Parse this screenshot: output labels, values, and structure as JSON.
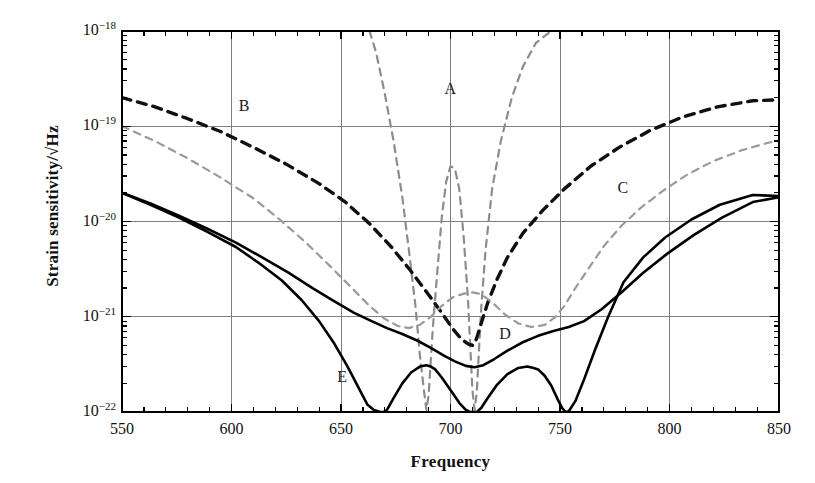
{
  "chart_data": {
    "type": "line",
    "title": "",
    "xlabel": "Frequency",
    "ylabel": "Strain sensitivity/√Hz",
    "xlim": [
      550,
      850
    ],
    "ylim": [
      1e-22,
      1e-18
    ],
    "yscale": "log",
    "xticks": [
      550,
      600,
      650,
      700,
      750,
      800,
      850
    ],
    "xtick_labels": [
      "550",
      "600",
      "650",
      "700",
      "750",
      "800",
      "850"
    ],
    "ytick_labels": [
      "10⁻¹⁸",
      "10⁻¹⁹",
      "10⁻²⁰",
      "10⁻²¹",
      "10⁻²²"
    ],
    "ytick_values": [
      1e-18,
      1e-19,
      1e-20,
      1e-21,
      1e-22
    ],
    "yticks_mantissa": [
      "10",
      "10",
      "10",
      "10",
      "10"
    ],
    "yticks_exponent": [
      "-18",
      "-19",
      "-20",
      "-21",
      "-22"
    ],
    "grid": true,
    "legend": "inline-labels",
    "series": [
      {
        "name": "A",
        "label": "A",
        "style": "dashed",
        "color": "#8c8c8c",
        "width": 2.2,
        "label_x": 700,
        "label_y": 2.4e-19,
        "x": [
          663,
          666,
          670,
          674,
          678,
          681,
          684,
          686,
          688,
          689,
          690,
          691,
          692,
          694,
          696,
          698,
          700,
          702,
          704,
          706,
          708,
          709,
          710,
          711,
          712,
          713,
          714,
          716,
          719,
          723,
          728,
          733,
          739,
          746,
          754,
          762,
          770
        ],
        "y": [
          1e-18,
          6e-19,
          2.2e-19,
          7e-20,
          1.8e-20,
          5e-21,
          1.3e-21,
          4e-22,
          1.6e-22,
          1.05e-22,
          1.5e-22,
          3.5e-22,
          8e-22,
          3e-21,
          1.1e-20,
          2.6e-20,
          3.8e-20,
          3.6e-20,
          2.2e-20,
          7e-21,
          1.5e-21,
          5e-22,
          1.7e-22,
          1.05e-22,
          1.6e-22,
          4.5e-22,
          1.2e-21,
          5e-21,
          2.2e-20,
          7e-20,
          2e-19,
          4.2e-19,
          7.5e-19,
          1e-18,
          1e-18,
          1e-18,
          1e-18
        ]
      },
      {
        "name": "B",
        "label": "B",
        "style": "dashed",
        "color": "#101010",
        "width": 3.4,
        "label_x": 606,
        "label_y": 1.6e-19,
        "x": [
          550,
          565,
          580,
          595,
          610,
          625,
          640,
          652,
          663,
          673,
          682,
          690,
          696,
          701,
          705,
          708,
          710,
          711,
          712,
          714,
          717,
          721,
          726,
          733,
          742,
          752,
          764,
          777,
          791,
          806,
          822,
          838,
          850
        ],
        "y": [
          2e-19,
          1.6e-19,
          1.2e-19,
          8.8e-20,
          6e-20,
          4e-20,
          2.5e-20,
          1.6e-20,
          9.5e-21,
          5.4e-21,
          3e-21,
          1.7e-21,
          1.1e-21,
          7.5e-22,
          5.8e-22,
          5.2e-22,
          5e-22,
          5.2e-22,
          6e-22,
          8.5e-22,
          1.4e-21,
          2.4e-21,
          4.2e-21,
          7.5e-21,
          1.3e-20,
          2.2e-20,
          3.8e-20,
          6e-20,
          9e-20,
          1.25e-19,
          1.6e-19,
          1.85e-19,
          1.9e-19
        ]
      },
      {
        "name": "C",
        "label": "C",
        "style": "dashed",
        "color": "#9a9a9a",
        "width": 2.2,
        "label_x": 779,
        "label_y": 2.2e-20,
        "x": [
          550,
          565,
          580,
          595,
          610,
          622,
          634,
          645,
          655,
          663,
          670,
          676,
          681,
          686,
          691,
          696,
          701,
          706,
          710,
          713,
          716,
          720,
          725,
          731,
          737,
          743,
          748,
          752,
          757,
          763,
          770,
          778,
          787,
          797,
          808,
          820,
          833,
          846,
          850
        ],
        "y": [
          1e-19,
          7e-20,
          4.6e-20,
          2.9e-20,
          1.75e-20,
          1.05e-20,
          6e-21,
          3.4e-21,
          2e-21,
          1.3e-21,
          9.5e-22,
          8e-22,
          7.6e-22,
          8.2e-22,
          1e-21,
          1.3e-21,
          1.6e-21,
          1.75e-21,
          1.8e-21,
          1.75e-21,
          1.6e-21,
          1.35e-21,
          1.05e-21,
          8.5e-22,
          7.8e-22,
          8.2e-22,
          1e-21,
          1.3e-21,
          2e-21,
          3.2e-21,
          5.5e-21,
          9e-21,
          1.4e-20,
          2.1e-20,
          3.1e-20,
          4.3e-20,
          5.6e-20,
          6.8e-20,
          7e-20
        ]
      },
      {
        "name": "D",
        "label": "D",
        "style": "solid",
        "color": "#000000",
        "width": 2.6,
        "label_x": 725,
        "label_y": 6.4e-22,
        "x": [
          550,
          563,
          576,
          589,
          602,
          614,
          626,
          637,
          647,
          656,
          664,
          671,
          678,
          685,
          691,
          697,
          702,
          707,
          711,
          715,
          720,
          726,
          733,
          740,
          747,
          754,
          761,
          769,
          778,
          788,
          799,
          811,
          824,
          838,
          850
        ],
        "y": [
          2e-20,
          1.55e-20,
          1.15e-20,
          8.4e-21,
          6e-21,
          4.2e-21,
          2.9e-21,
          2e-21,
          1.45e-21,
          1.1e-21,
          9e-22,
          7.6e-22,
          6.6e-22,
          5.6e-22,
          4.7e-22,
          3.9e-22,
          3.4e-22,
          3.05e-22,
          2.95e-22,
          3.1e-22,
          3.6e-22,
          4.4e-22,
          5.4e-22,
          6.3e-22,
          7.1e-22,
          7.8e-22,
          9e-22,
          1.2e-21,
          1.8e-21,
          2.9e-21,
          4.6e-21,
          7.2e-21,
          1.1e-20,
          1.6e-20,
          1.8e-20
        ]
      },
      {
        "name": "E",
        "label": "E",
        "style": "solid",
        "color": "#000000",
        "width": 2.6,
        "label_x": 651,
        "label_y": 2.3e-22,
        "x": [
          550,
          563,
          576,
          589,
          602,
          613,
          623,
          632,
          640,
          647,
          653,
          658,
          662,
          665,
          668,
          669.5,
          671,
          674,
          678,
          682,
          686,
          689,
          691,
          693,
          696,
          700,
          704,
          707,
          709,
          710.5,
          712,
          714,
          717,
          721,
          726,
          731,
          735,
          738,
          740,
          743,
          746,
          749,
          751,
          752.5,
          754,
          757,
          761,
          766,
          772,
          779,
          788,
          798,
          810,
          823,
          838,
          850
        ],
        "y": [
          2e-20,
          1.5e-20,
          1.1e-20,
          7.8e-21,
          5.4e-21,
          3.6e-21,
          2.4e-21,
          1.5e-21,
          9e-22,
          5.2e-22,
          3e-22,
          1.8e-22,
          1.2e-22,
          1.05e-22,
          1e-22,
          1e-22,
          1.05e-22,
          1.4e-22,
          2e-22,
          2.6e-22,
          3e-22,
          3.1e-22,
          3e-22,
          2.8e-22,
          2.3e-22,
          1.7e-22,
          1.25e-22,
          1.05e-22,
          1e-22,
          1e-22,
          1e-22,
          1.1e-22,
          1.4e-22,
          1.9e-22,
          2.5e-22,
          2.9e-22,
          3e-22,
          2.9e-22,
          2.8e-22,
          2.4e-22,
          1.9e-22,
          1.35e-22,
          1.1e-22,
          1e-22,
          1.02e-22,
          1.3e-22,
          2.2e-22,
          4.5e-22,
          1e-21,
          2.3e-21,
          4.2e-21,
          6.8e-21,
          1.05e-20,
          1.5e-20,
          1.9e-20,
          1.85e-20
        ]
      }
    ]
  },
  "axes": {
    "frame_color": "#000000",
    "grid_color": "#808080",
    "background": "#ffffff"
  }
}
